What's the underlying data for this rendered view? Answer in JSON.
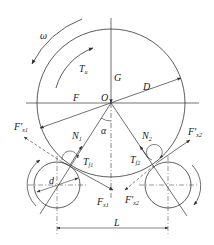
{
  "diagram": {
    "type": "force-diagram",
    "colors": {
      "stroke": "#333333",
      "text": "#222222",
      "background": "#ffffff"
    },
    "main_circle": {
      "center_label": "O",
      "diameter_label": "D"
    },
    "labels": {
      "omega": "ω",
      "torque_main": "T",
      "torque_main_sub": "u",
      "gravity": "G",
      "force_F": "F",
      "center": "O",
      "diameter": "D",
      "angle": "α",
      "normal_1": "N",
      "normal_1_sub": "1",
      "normal_2": "N",
      "normal_2_sub": "2",
      "torque_f1": "T",
      "torque_f1_sub": "f1",
      "torque_f2": "T",
      "torque_f2_sub": "f2",
      "roller_diameter": "d",
      "fx1_prime": "F'",
      "fx1_prime_sub": "x1",
      "fx2_prime": "F'",
      "fx2_prime_sub": "x2",
      "fx1": "F",
      "fx1_sub": "x1",
      "fx2_lower_prime": "F'",
      "fx2_lower_prime_sub": "x2",
      "distance": "L"
    }
  }
}
